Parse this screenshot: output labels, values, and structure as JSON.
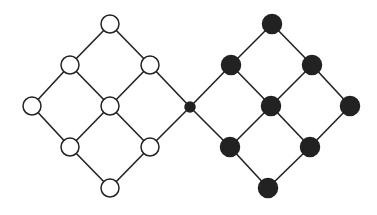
{
  "diagram": {
    "colors": {
      "edge": "#222222",
      "open_fill": "#ffffff",
      "filled_fill": "#222222"
    },
    "nodes": [
      {
        "id": "L1",
        "x": 110,
        "y": 24,
        "r": 9,
        "style": "open"
      },
      {
        "id": "L2",
        "x": 70,
        "y": 65,
        "r": 9,
        "style": "open"
      },
      {
        "id": "L3",
        "x": 150,
        "y": 65,
        "r": 9,
        "style": "open"
      },
      {
        "id": "L4",
        "x": 32,
        "y": 106,
        "r": 9,
        "style": "open"
      },
      {
        "id": "L5",
        "x": 110,
        "y": 106,
        "r": 9,
        "style": "open"
      },
      {
        "id": "L6",
        "x": 70,
        "y": 147,
        "r": 9,
        "style": "open"
      },
      {
        "id": "L7",
        "x": 150,
        "y": 147,
        "r": 9,
        "style": "open"
      },
      {
        "id": "L8",
        "x": 110,
        "y": 188,
        "r": 9,
        "style": "open"
      },
      {
        "id": "C",
        "x": 190,
        "y": 107,
        "r": 5,
        "style": "filled"
      },
      {
        "id": "R1",
        "x": 272,
        "y": 24,
        "r": 9.5,
        "style": "filled"
      },
      {
        "id": "R2",
        "x": 231,
        "y": 65,
        "r": 9.5,
        "style": "filled"
      },
      {
        "id": "R3",
        "x": 312,
        "y": 65,
        "r": 9.5,
        "style": "filled"
      },
      {
        "id": "R4",
        "x": 271,
        "y": 106,
        "r": 9.5,
        "style": "filled"
      },
      {
        "id": "R5",
        "x": 350,
        "y": 106,
        "r": 9.5,
        "style": "filled"
      },
      {
        "id": "R6",
        "x": 230,
        "y": 147,
        "r": 9.5,
        "style": "filled"
      },
      {
        "id": "R7",
        "x": 310,
        "y": 147,
        "r": 9.5,
        "style": "filled"
      },
      {
        "id": "R8",
        "x": 268,
        "y": 188,
        "r": 9.5,
        "style": "filled"
      }
    ],
    "edges": [
      [
        "L1",
        "L2"
      ],
      [
        "L1",
        "L3"
      ],
      [
        "L2",
        "L4"
      ],
      [
        "L2",
        "L5"
      ],
      [
        "L3",
        "L5"
      ],
      [
        "L3",
        "C"
      ],
      [
        "L4",
        "L6"
      ],
      [
        "L5",
        "L6"
      ],
      [
        "L5",
        "L7"
      ],
      [
        "L6",
        "L8"
      ],
      [
        "L7",
        "L8"
      ],
      [
        "L7",
        "C"
      ],
      [
        "C",
        "R2"
      ],
      [
        "C",
        "R6"
      ],
      [
        "R1",
        "R2"
      ],
      [
        "R1",
        "R3"
      ],
      [
        "R2",
        "R4"
      ],
      [
        "R3",
        "R4"
      ],
      [
        "R3",
        "R5"
      ],
      [
        "R4",
        "R6"
      ],
      [
        "R4",
        "R7"
      ],
      [
        "R5",
        "R7"
      ],
      [
        "R6",
        "R8"
      ],
      [
        "R7",
        "R8"
      ]
    ]
  }
}
